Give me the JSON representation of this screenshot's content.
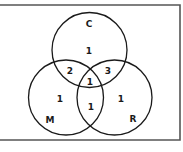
{
  "diagram": {
    "type": "venn",
    "sets": [
      {
        "id": "C",
        "label": "C",
        "cx": 89.5,
        "cy": 50,
        "r": 37.5
      },
      {
        "id": "M",
        "label": "M",
        "cx": 66,
        "cy": 97.5,
        "r": 37.5
      },
      {
        "id": "R",
        "label": "R",
        "cx": 114.5,
        "cy": 97.5,
        "r": 37.5
      }
    ],
    "regions": {
      "C_only": "1",
      "M_only": "1",
      "R_only": "1",
      "C_and_M": "2",
      "C_and_R": "3",
      "M_and_R": "1",
      "C_M_R": "1"
    },
    "colors": {
      "stroke": "#1a1a1a",
      "border": "#555555",
      "background": "#ffffff"
    }
  }
}
